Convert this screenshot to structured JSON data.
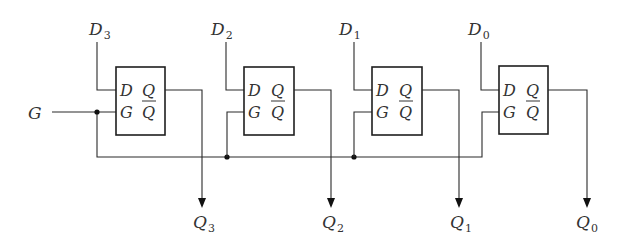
{
  "diagram": {
    "input_gate": {
      "label": "G"
    },
    "latches": [
      {
        "id": "latch-3",
        "data_in": {
          "main": "D",
          "sub": "3"
        },
        "pins": {
          "d": "D",
          "g": "G",
          "q": "Q",
          "qbar": "Q"
        },
        "output": {
          "main": "Q",
          "sub": "3"
        }
      },
      {
        "id": "latch-2",
        "data_in": {
          "main": "D",
          "sub": "2"
        },
        "pins": {
          "d": "D",
          "g": "G",
          "q": "Q",
          "qbar": "Q"
        },
        "output": {
          "main": "Q",
          "sub": "2"
        }
      },
      {
        "id": "latch-1",
        "data_in": {
          "main": "D",
          "sub": "1"
        },
        "pins": {
          "d": "D",
          "g": "G",
          "q": "Q",
          "qbar": "Q"
        },
        "output": {
          "main": "Q",
          "sub": "1"
        }
      },
      {
        "id": "latch-0",
        "data_in": {
          "main": "D",
          "sub": "0"
        },
        "pins": {
          "d": "D",
          "g": "G",
          "q": "Q",
          "qbar": "Q"
        },
        "output": {
          "main": "Q",
          "sub": "0"
        }
      }
    ],
    "colors": {
      "wire": "#2a2a2a",
      "box": "#1e1e1e",
      "text": "#333333"
    }
  }
}
